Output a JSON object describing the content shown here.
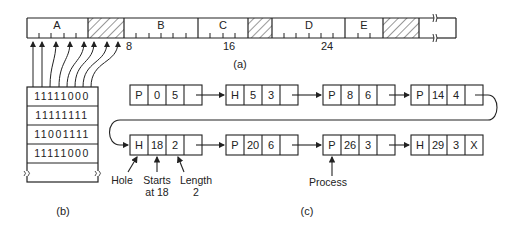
{
  "figure_a": {
    "caption": "(a)",
    "units_per_tick": 1,
    "unit_px": 13.6,
    "segments": [
      {
        "label": "A",
        "start": 0,
        "length": 5,
        "type": "process"
      },
      {
        "label": "",
        "start": 5,
        "length": 3,
        "type": "hole"
      },
      {
        "label": "B",
        "start": 8,
        "length": 6,
        "type": "process"
      },
      {
        "label": "C",
        "start": 14,
        "length": 4,
        "type": "process"
      },
      {
        "label": "",
        "start": 18,
        "length": 2,
        "type": "hole"
      },
      {
        "label": "D",
        "start": 20,
        "length": 6,
        "type": "process"
      },
      {
        "label": "E",
        "start": 26,
        "length": 3,
        "type": "process"
      },
      {
        "label": "",
        "start": 29,
        "length": 3,
        "type": "hole"
      }
    ],
    "tick_labels": [
      {
        "value": 8,
        "text": "8"
      },
      {
        "value": 16,
        "text": "16"
      },
      {
        "value": 24,
        "text": "24"
      }
    ]
  },
  "figure_b": {
    "caption": "(b)",
    "rows": [
      "11111000",
      "11111111",
      "11001111",
      "11111000"
    ]
  },
  "figure_c": {
    "caption": "(c)",
    "row1": [
      {
        "type": "P",
        "start": "0",
        "length": "5",
        "next": ""
      },
      {
        "type": "H",
        "start": "5",
        "length": "3",
        "next": ""
      },
      {
        "type": "P",
        "start": "8",
        "length": "6",
        "next": ""
      },
      {
        "type": "P",
        "start": "14",
        "length": "4",
        "next": ""
      }
    ],
    "row2": [
      {
        "type": "H",
        "start": "18",
        "length": "2",
        "next": ""
      },
      {
        "type": "P",
        "start": "20",
        "length": "6",
        "next": ""
      },
      {
        "type": "P",
        "start": "26",
        "length": "3",
        "next": ""
      },
      {
        "type": "H",
        "start": "29",
        "length": "3",
        "next": "X"
      }
    ],
    "annotations": {
      "hole": "Hole",
      "starts_line1": "Starts",
      "starts_line2": "at 18",
      "length_line1": "Length",
      "length_line2": "2",
      "process": "Process"
    }
  },
  "colors": {
    "line": "#222222",
    "hatch": "#333333",
    "background": "#ffffff"
  }
}
